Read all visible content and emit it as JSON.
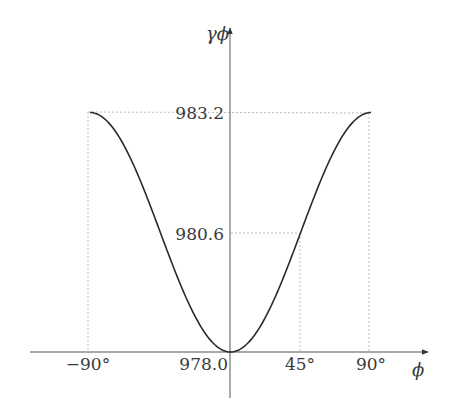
{
  "chart_data": {
    "type": "line",
    "title": "",
    "xlabel": "ϕ",
    "ylabel": "γϕ",
    "x_ticks": [
      {
        "value": -90,
        "label": "−90°"
      },
      {
        "value": 45,
        "label": "45°"
      },
      {
        "value": 90,
        "label": "90°"
      }
    ],
    "y_ticks": [
      {
        "value": 978.0,
        "label": "978.0"
      },
      {
        "value": 980.6,
        "label": "980.6"
      },
      {
        "value": 983.2,
        "label": "983.2"
      }
    ],
    "xlim": [
      -90,
      90
    ],
    "ylim": [
      978.0,
      983.2
    ],
    "grid": false,
    "guide_lines": [
      {
        "x": -90,
        "y": 983.2
      },
      {
        "x": 90,
        "y": 983.2
      },
      {
        "x": 45,
        "y": 980.6
      }
    ],
    "series": [
      {
        "name": "gamma_phi",
        "x": [
          -90,
          -75,
          -60,
          -45,
          -30,
          -15,
          0,
          15,
          30,
          45,
          60,
          75,
          90
        ],
        "values": [
          983.2,
          982.85,
          981.9,
          980.6,
          979.3,
          978.35,
          978.0,
          978.35,
          979.3,
          980.6,
          981.9,
          982.85,
          983.2
        ]
      }
    ],
    "color": "#2a2a2a"
  }
}
